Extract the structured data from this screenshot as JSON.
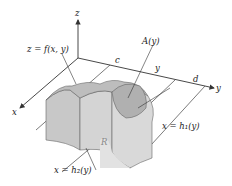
{
  "figure": {
    "axes": {
      "z_label": "z",
      "x_label": "x",
      "y_label": "y"
    },
    "labels": {
      "surface": "z = f(x, y)",
      "cross_section": "A(y)",
      "c": "c",
      "y_slice": "y",
      "d": "d",
      "region": "R",
      "right_boundary": "x = h₁(y)",
      "left_boundary": "x = h₂(y)"
    },
    "colors": {
      "axis": "#333333",
      "solid_light": "#d9d9d9",
      "solid_mid": "#c4c4c4",
      "solid_dark": "#aaaaaa",
      "cross_section": "#b8b8b8",
      "line": "#555555"
    }
  }
}
